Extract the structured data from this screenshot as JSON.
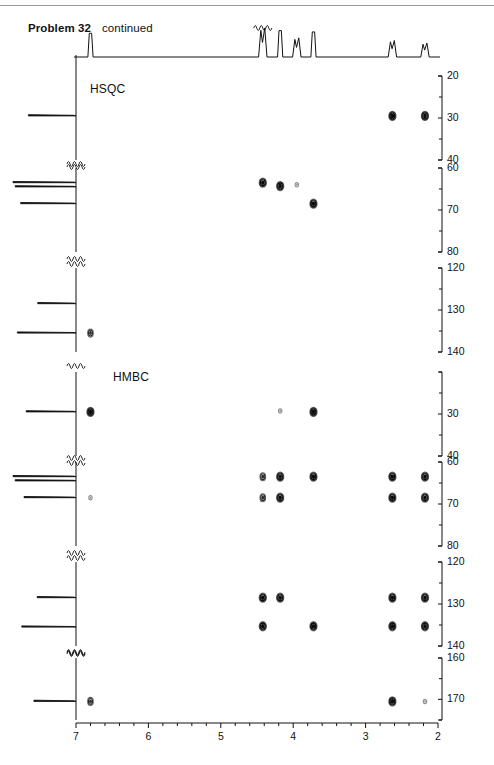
{
  "page": {
    "problem_label": "Problem 32",
    "continued_label": "continued",
    "width": 494,
    "height": 765
  },
  "panels": [
    {
      "name": "HSQC",
      "label": "HSQC"
    },
    {
      "name": "HMBC",
      "label": "HMBC"
    }
  ],
  "x_axis": {
    "label": "",
    "unit": "ppm",
    "direction": "reversed",
    "min": 2,
    "max": 7,
    "tick_labels": [
      "7",
      "6",
      "5",
      "4",
      "3",
      "2"
    ],
    "tick_values": [
      7,
      6,
      5,
      4,
      3,
      2
    ],
    "minor_per_interval": 5,
    "pixel_left": 76,
    "pixel_right": 438
  },
  "y_axis": {
    "unit": "ppm",
    "direction": "reversed",
    "segments": [
      {
        "panel": "HSQC",
        "min": 20,
        "max": 40,
        "labels": [
          "20",
          "30",
          "40"
        ],
        "values": [
          20,
          30,
          40
        ],
        "top_px": 76,
        "bottom_px": 160
      },
      {
        "panel": "HSQC",
        "min": 60,
        "max": 80,
        "labels": [
          "60",
          "70",
          "80"
        ],
        "values": [
          60,
          70,
          80
        ],
        "top_px": 168,
        "bottom_px": 252
      },
      {
        "panel": "HSQC",
        "min": 120,
        "max": 140,
        "labels": [
          "120",
          "130",
          "140"
        ],
        "values": [
          120,
          130,
          140
        ],
        "top_px": 268,
        "bottom_px": 352
      },
      {
        "panel": "HMBC",
        "min": 20,
        "max": 40,
        "labels": [
          "30",
          "40"
        ],
        "values": [
          30,
          40
        ],
        "top_px": 372,
        "bottom_px": 456
      },
      {
        "panel": "HMBC",
        "min": 60,
        "max": 80,
        "labels": [
          "60",
          "70",
          "80"
        ],
        "values": [
          60,
          70,
          80
        ],
        "top_px": 462,
        "bottom_px": 546
      },
      {
        "panel": "HMBC",
        "min": 120,
        "max": 140,
        "labels": [
          "120",
          "130",
          "140"
        ],
        "values": [
          120,
          130,
          140
        ],
        "top_px": 562,
        "bottom_px": 646
      },
      {
        "panel": "HMBC",
        "min": 160,
        "max": 175,
        "labels": [
          "160",
          "170"
        ],
        "values": [
          160,
          170
        ],
        "top_px": 658,
        "bottom_px": 720
      }
    ]
  },
  "chart_data": {
    "type": "scatter",
    "xlabel": "1H chemical shift (ppm)",
    "ylabel": "13C chemical shift (ppm)",
    "xlim": [
      7,
      2
    ],
    "grid": false,
    "legend": "none",
    "proton_1d_peaks": [
      {
        "shift": 6.8,
        "height": 0.72,
        "multiplicity": "s",
        "truncated": false
      },
      {
        "shift": 4.42,
        "height": 0.88,
        "multiplicity": "m",
        "truncated": true
      },
      {
        "shift": 4.18,
        "height": 0.8,
        "multiplicity": "s",
        "truncated": false
      },
      {
        "shift": 3.95,
        "height": 0.58,
        "multiplicity": "d",
        "truncated": false
      },
      {
        "shift": 3.72,
        "height": 0.76,
        "multiplicity": "s",
        "truncated": false
      },
      {
        "shift": 2.63,
        "height": 0.5,
        "multiplicity": "m",
        "truncated": false
      },
      {
        "shift": 2.18,
        "height": 0.42,
        "multiplicity": "m",
        "truncated": false
      }
    ],
    "carbon_1d_peaks_hsqc": [
      {
        "shift": 29.5,
        "height": 0.72
      },
      {
        "shift": 63.5,
        "height": 1.0
      },
      {
        "shift": 64.5,
        "height": 0.96
      },
      {
        "shift": 68.5,
        "height": 0.86
      },
      {
        "shift": 128.5,
        "height": 0.55
      },
      {
        "shift": 135.5,
        "height": 0.92
      }
    ],
    "carbon_1d_peaks_hmbc": [
      {
        "shift": 29.5,
        "height": 0.76
      },
      {
        "shift": 63.5,
        "height": 1.0
      },
      {
        "shift": 64.5,
        "height": 0.96
      },
      {
        "shift": 68.5,
        "height": 0.8
      },
      {
        "shift": 128.5,
        "height": 0.56
      },
      {
        "shift": 135.5,
        "height": 0.84
      },
      {
        "shift": 170.5,
        "height": 0.62
      }
    ],
    "series": [
      {
        "name": "HSQC cross peaks",
        "experiment": "HSQC",
        "points": [
          {
            "h": 2.63,
            "c": 29.5,
            "intensity": "strong"
          },
          {
            "h": 2.18,
            "c": 29.5,
            "intensity": "strong"
          },
          {
            "h": 4.42,
            "c": 63.5,
            "intensity": "strong"
          },
          {
            "h": 4.18,
            "c": 64.3,
            "intensity": "strong"
          },
          {
            "h": 3.95,
            "c": 64.0,
            "intensity": "weak"
          },
          {
            "h": 3.72,
            "c": 68.5,
            "intensity": "strong"
          },
          {
            "h": 6.8,
            "c": 135.5,
            "intensity": "medium"
          }
        ]
      },
      {
        "name": "HMBC cross peaks",
        "experiment": "HMBC",
        "points": [
          {
            "h": 6.8,
            "c": 29.5,
            "intensity": "strong"
          },
          {
            "h": 4.18,
            "c": 29.3,
            "intensity": "weak"
          },
          {
            "h": 3.72,
            "c": 29.5,
            "intensity": "strong"
          },
          {
            "h": 4.42,
            "c": 63.5,
            "intensity": "medium"
          },
          {
            "h": 4.18,
            "c": 63.5,
            "intensity": "strong"
          },
          {
            "h": 3.72,
            "c": 63.5,
            "intensity": "strong"
          },
          {
            "h": 2.63,
            "c": 63.5,
            "intensity": "strong"
          },
          {
            "h": 2.18,
            "c": 63.5,
            "intensity": "strong"
          },
          {
            "h": 6.8,
            "c": 68.5,
            "intensity": "weak"
          },
          {
            "h": 4.42,
            "c": 68.5,
            "intensity": "medium"
          },
          {
            "h": 4.18,
            "c": 68.5,
            "intensity": "strong"
          },
          {
            "h": 2.63,
            "c": 68.5,
            "intensity": "strong"
          },
          {
            "h": 2.18,
            "c": 68.5,
            "intensity": "strong"
          },
          {
            "h": 4.42,
            "c": 128.5,
            "intensity": "strong"
          },
          {
            "h": 4.18,
            "c": 128.5,
            "intensity": "strong"
          },
          {
            "h": 2.63,
            "c": 128.5,
            "intensity": "strong"
          },
          {
            "h": 2.18,
            "c": 128.5,
            "intensity": "strong"
          },
          {
            "h": 4.42,
            "c": 135.3,
            "intensity": "strong"
          },
          {
            "h": 3.72,
            "c": 135.3,
            "intensity": "strong"
          },
          {
            "h": 2.63,
            "c": 135.3,
            "intensity": "strong"
          },
          {
            "h": 2.18,
            "c": 135.3,
            "intensity": "strong"
          },
          {
            "h": 6.8,
            "c": 170.5,
            "intensity": "medium"
          },
          {
            "h": 2.63,
            "c": 170.5,
            "intensity": "strong"
          },
          {
            "h": 2.18,
            "c": 170.5,
            "intensity": "weak"
          }
        ]
      }
    ]
  },
  "colors": {
    "ink": "#111111",
    "rule": "#9a9a9a",
    "peak_strong": "#0c0c0c",
    "peak_weak": "#8a8a8a",
    "background": "#ffffff"
  }
}
